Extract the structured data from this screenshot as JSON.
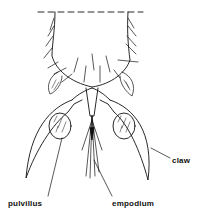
{
  "diagram": {
    "labels": {
      "claw": "claw",
      "pulvillus": "pulvillus",
      "empodium": "empodium"
    },
    "colors": {
      "line": "#111111",
      "background": "#ffffff"
    }
  }
}
